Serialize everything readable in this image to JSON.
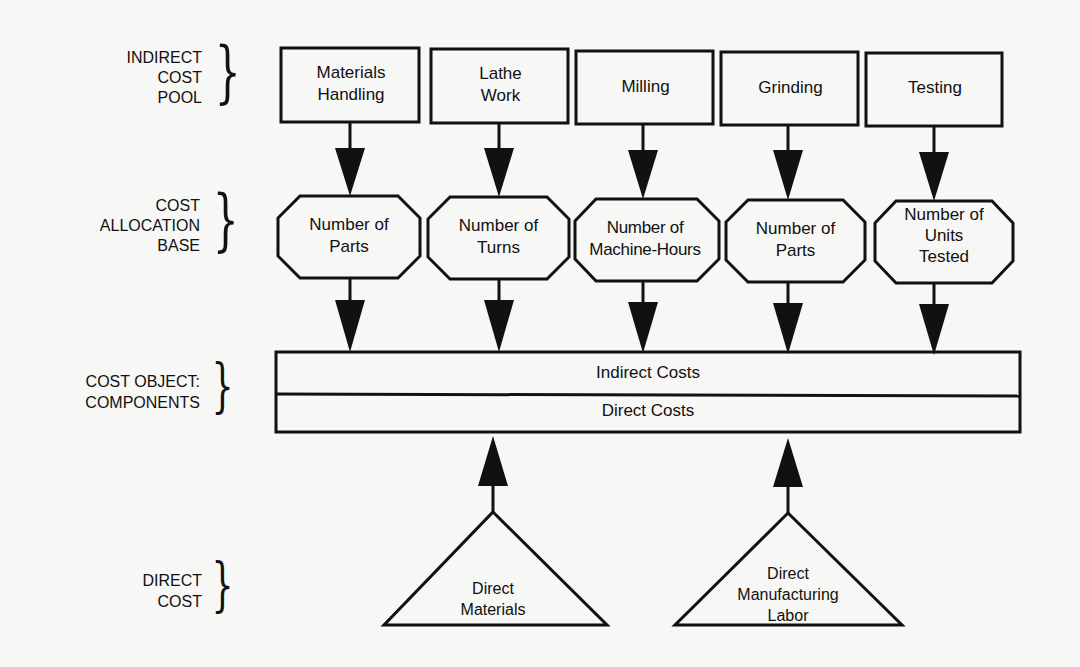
{
  "row_labels": {
    "indirect_cost_pool": [
      "INDIRECT",
      "COST",
      "POOL"
    ],
    "cost_allocation_base": [
      "COST",
      "ALLOCATION",
      "BASE"
    ],
    "cost_object": [
      "COST OBJECT:",
      "COMPONENTS"
    ],
    "direct_cost": [
      "DIRECT",
      "COST"
    ]
  },
  "cost_pools": [
    {
      "lines": [
        "Materials",
        "Handling"
      ]
    },
    {
      "lines": [
        "Lathe",
        "Work"
      ]
    },
    {
      "lines": [
        "Milling"
      ]
    },
    {
      "lines": [
        "Grinding"
      ]
    },
    {
      "lines": [
        "Testing"
      ]
    }
  ],
  "allocation_bases": [
    {
      "lines": [
        "Number of",
        "Parts"
      ]
    },
    {
      "lines": [
        "Number of",
        "Turns"
      ]
    },
    {
      "lines": [
        "Number of",
        "Machine-Hours"
      ]
    },
    {
      "lines": [
        "Number of",
        "Parts"
      ]
    },
    {
      "lines": [
        "Number of",
        "Units",
        "Tested"
      ]
    }
  ],
  "cost_object": {
    "indirect_label": "Indirect Costs",
    "direct_label": "Direct Costs"
  },
  "direct_costs": [
    {
      "lines": [
        "Direct",
        "Materials"
      ]
    },
    {
      "lines": [
        "Direct",
        "Manufacturing",
        "Labor"
      ]
    }
  ],
  "colors": {
    "stroke": "#111111",
    "background": "#f7f7f5"
  }
}
